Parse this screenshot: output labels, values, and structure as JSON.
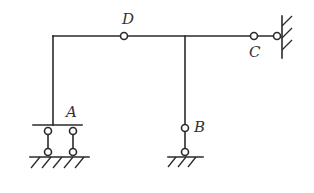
{
  "diagram": {
    "title": "",
    "type": "structural frame",
    "labels": {
      "A": "A",
      "B": "B",
      "C": "C",
      "D": "D"
    },
    "nodes": [
      {
        "id": "corner",
        "x": 53,
        "y": 36
      },
      {
        "id": "D",
        "type": "hinge",
        "x": 124,
        "y": 36
      },
      {
        "id": "junction",
        "x": 185,
        "y": 36
      },
      {
        "id": "C",
        "type": "hinge",
        "x": 254,
        "y": 36
      },
      {
        "id": "wall-hinge",
        "type": "hinge",
        "x": 277,
        "y": 36
      },
      {
        "id": "A",
        "type": "double link support",
        "x": 53,
        "y": 125
      },
      {
        "id": "B",
        "type": "hinge",
        "x": 185,
        "y": 128
      },
      {
        "id": "B-support",
        "type": "hinge",
        "x": 185,
        "y": 152
      }
    ],
    "supports": [
      {
        "at": "A",
        "kind": "two vertical links to ground"
      },
      {
        "at": "B",
        "kind": "hinged link to ground"
      },
      {
        "at": "C",
        "kind": "link to fixed wall"
      }
    ],
    "colors": {
      "line": "#2a2a2a",
      "label": "#333333",
      "background": "#ffffff"
    }
  }
}
